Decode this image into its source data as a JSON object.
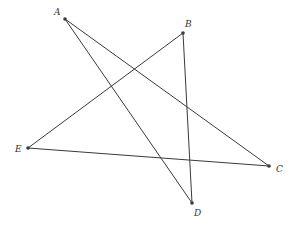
{
  "diagram": {
    "type": "pentagram",
    "points": [
      {
        "id": "A",
        "label": "A",
        "x": 65,
        "y": 19,
        "lx": 54,
        "ly": 15
      },
      {
        "id": "B",
        "label": "B",
        "x": 183,
        "y": 33,
        "lx": 185,
        "ly": 27
      },
      {
        "id": "C",
        "label": "C",
        "x": 269,
        "y": 166,
        "lx": 276,
        "ly": 172
      },
      {
        "id": "D",
        "label": "D",
        "x": 192,
        "y": 203,
        "lx": 194,
        "ly": 216
      },
      {
        "id": "E",
        "label": "E",
        "x": 28,
        "y": 148,
        "lx": 15,
        "ly": 152
      }
    ],
    "segments": [
      [
        "A",
        "C"
      ],
      [
        "A",
        "D"
      ],
      [
        "B",
        "D"
      ],
      [
        "B",
        "E"
      ],
      [
        "E",
        "C"
      ]
    ],
    "colors": {
      "line": "#3a3a3a",
      "label": "#333333",
      "background": "#ffffff"
    }
  }
}
